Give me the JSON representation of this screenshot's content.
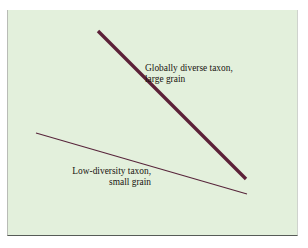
{
  "figure": {
    "caption_fragment": "",
    "panel_background_color": "#e3f0dc",
    "labels": {
      "high_diversity": {
        "line1": "Globally diverse taxon,",
        "line2": "large grain"
      },
      "low_diversity": {
        "line1": "Low-diversity taxon,",
        "line2": "small grain"
      }
    }
  },
  "chart_data": {
    "type": "line",
    "title": "",
    "subtitle": "",
    "xlabel": "",
    "ylabel": "",
    "xlim": [
      0,
      291
    ],
    "ylim": [
      226,
      0
    ],
    "grid": false,
    "axes_visible": false,
    "tick_labels": [],
    "legend": {
      "position": "inline-annotation",
      "entries": [
        "Globally diverse taxon, large grain",
        "Low-diversity taxon, small grain"
      ]
    },
    "series": [
      {
        "name": "Globally diverse taxon, large grain",
        "style": "thick-solid",
        "color": "#5c2138",
        "stroke_width": 3.4,
        "x": [
          90,
          238
        ],
        "y": [
          21,
          169
        ],
        "slope": "steep-negative",
        "annotation": "Globally diverse taxon, large grain"
      },
      {
        "name": "Low-diversity taxon, small grain",
        "style": "thin-solid",
        "color": "#57243a",
        "stroke_width": 1.1,
        "x": [
          28,
          239
        ],
        "y": [
          123,
          184
        ],
        "slope": "shallow-negative",
        "annotation": "Low-diversity taxon, small grain"
      }
    ],
    "annotations": [
      {
        "text": "Globally diverse taxon, large grain",
        "x": 137,
        "y": 53,
        "align": "left"
      },
      {
        "text": "Low-diversity taxon, small grain",
        "x": 143,
        "y": 156,
        "align": "right"
      }
    ]
  }
}
